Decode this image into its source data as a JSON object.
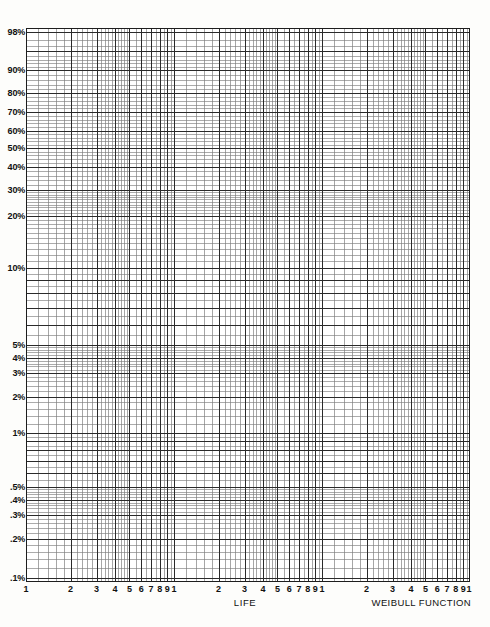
{
  "page": {
    "background_color": "#fdfdfb",
    "grid_color": "#2a2a2a",
    "minor_grid_color": "#7d7d7d"
  },
  "captions": {
    "x_axis_caption": "LIFE",
    "chart_caption": "WEIBULL FUNCTION"
  },
  "chart_data": {
    "type": "line",
    "chart_kind": "weibull-probability-graph-paper",
    "title": "",
    "subtitle": "",
    "xlabel": "LIFE",
    "ylabel": "",
    "annotation": "WEIBULL FUNCTION",
    "grid": true,
    "legend": null,
    "series": [],
    "x_axis": {
      "scale": "log10",
      "decades": 3,
      "range": [
        1,
        1000
      ],
      "tick_labels": [
        "1",
        "2",
        "3",
        "4",
        "5",
        "6",
        "7",
        "8",
        "9",
        "1",
        "2",
        "3",
        "4",
        "5",
        "6",
        "7",
        "8",
        "9",
        "1",
        "2",
        "3",
        "4",
        "5",
        "6",
        "7",
        "8",
        "9",
        "1"
      ],
      "tick_values": [
        1,
        2,
        3,
        4,
        5,
        6,
        7,
        8,
        9,
        10,
        20,
        30,
        40,
        50,
        60,
        70,
        80,
        90,
        100,
        200,
        300,
        400,
        500,
        600,
        700,
        800,
        900,
        1000
      ],
      "minor_subdivisions_per_interval": 5
    },
    "y_axis": {
      "scale": "weibull-cumulative-probability",
      "units": "percent",
      "direction": "top-is-high",
      "range_percent": [
        0.1,
        98
      ],
      "tick_labels": [
        "98%",
        "90%",
        "80%",
        "70%",
        "60%",
        "50%",
        "40%",
        "30%",
        "20%",
        "10%",
        "5%",
        "4%",
        "3%",
        "2%",
        "1%",
        ".5%",
        ".4%",
        ".3%",
        ".2%",
        ".1%"
      ],
      "tick_values_percent": [
        98,
        90,
        80,
        70,
        60,
        50,
        40,
        30,
        20,
        10,
        5,
        4,
        3,
        2,
        1,
        0.5,
        0.4,
        0.3,
        0.2,
        0.1
      ],
      "tick_pixel_y": [
        4,
        42,
        65,
        84,
        103,
        120,
        139,
        162,
        188,
        240,
        317,
        330,
        345,
        369,
        405,
        459,
        472,
        487,
        511,
        550
      ]
    }
  }
}
